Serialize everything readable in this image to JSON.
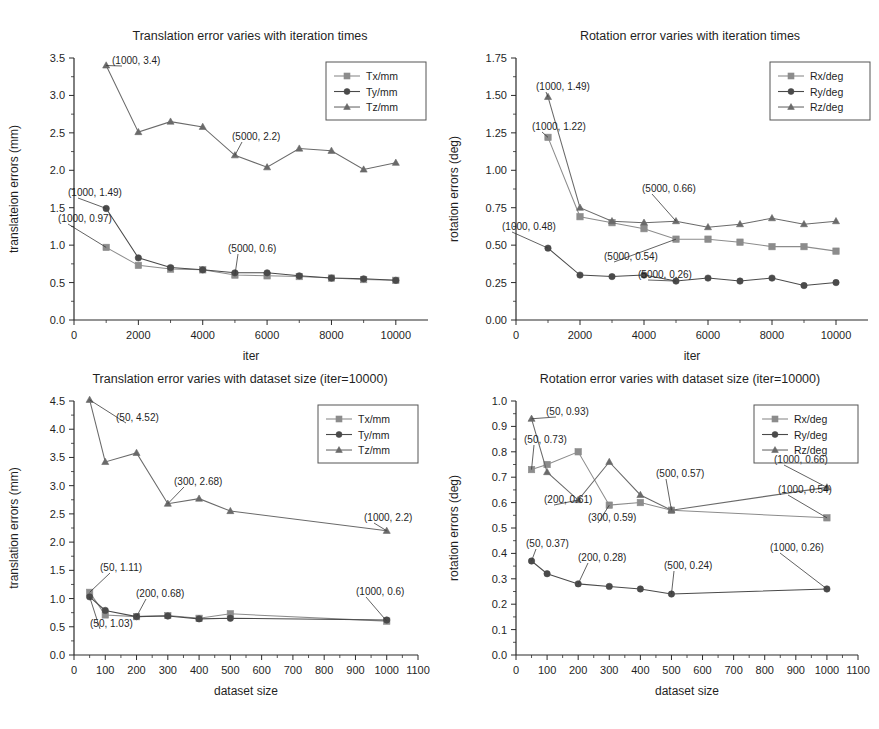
{
  "figure": {
    "background": "#ffffff",
    "series_colors": {
      "x": "#8c8c8c",
      "y": "#4a4a4a",
      "z": "#6a6a6a"
    }
  },
  "chart_data": [
    {
      "id": "translation-vs-iterations",
      "type": "line",
      "title": "Translation error varies with iteration times",
      "xlabel": "iter",
      "ylabel": "translateion errors (mm)",
      "xlim": [
        0,
        11000
      ],
      "ylim": [
        0.0,
        3.5
      ],
      "xticks": [
        0,
        2000,
        4000,
        6000,
        8000,
        10000
      ],
      "xticklabels": [
        "0",
        "2000",
        "4000",
        "6000",
        "8000",
        "10000"
      ],
      "yticks": [
        0.0,
        0.5,
        1.0,
        1.5,
        2.0,
        2.5,
        3.0,
        3.5
      ],
      "yticklabels": [
        "0.0",
        "0.5",
        "1.0",
        "1.5",
        "2.0",
        "2.5",
        "3.0",
        "3.5"
      ],
      "grid": false,
      "legend_position": "upper right",
      "x": [
        1000,
        2000,
        3000,
        4000,
        5000,
        6000,
        7000,
        8000,
        9000,
        10000
      ],
      "series": [
        {
          "name": "Tx/mm",
          "marker": "square",
          "values": [
            0.97,
            0.73,
            0.68,
            0.67,
            0.6,
            0.59,
            0.58,
            0.56,
            0.54,
            0.53
          ]
        },
        {
          "name": "Ty/mm",
          "marker": "circle",
          "values": [
            1.49,
            0.83,
            0.7,
            0.67,
            0.63,
            0.63,
            0.59,
            0.56,
            0.55,
            0.53
          ]
        },
        {
          "name": "Tz/mm",
          "marker": "triangle",
          "values": [
            3.4,
            2.51,
            2.65,
            2.58,
            2.2,
            2.04,
            2.29,
            2.26,
            2.01,
            2.1
          ]
        }
      ],
      "annotations": [
        {
          "text": "(1000, 3.4)",
          "point": [
            1000,
            3.4
          ]
        },
        {
          "text": "(5000, 2.2)",
          "point": [
            5000,
            2.2
          ]
        },
        {
          "text": "(1000, 1.49)",
          "point": [
            1000,
            1.49
          ]
        },
        {
          "text": "(1000, 0.97)",
          "point": [
            1000,
            0.97
          ]
        },
        {
          "text": "(5000, 0.6)",
          "point": [
            5000,
            0.6
          ]
        }
      ]
    },
    {
      "id": "rotation-vs-iterations",
      "type": "line",
      "title": "Rotation error varies with iteration times",
      "xlabel": "iter",
      "ylabel": "rotation errors (deg)",
      "xlim": [
        0,
        11000
      ],
      "ylim": [
        0.0,
        1.75
      ],
      "xticks": [
        0,
        2000,
        4000,
        6000,
        8000,
        10000
      ],
      "xticklabels": [
        "0",
        "2000",
        "4000",
        "6000",
        "8000",
        "10000"
      ],
      "yticks": [
        0.0,
        0.25,
        0.5,
        0.75,
        1.0,
        1.25,
        1.5,
        1.75
      ],
      "yticklabels": [
        "0.00",
        "0.25",
        "0.50",
        "0.75",
        "1.00",
        "1.25",
        "1.50",
        "1.75"
      ],
      "grid": false,
      "legend_position": "upper right",
      "x": [
        1000,
        2000,
        3000,
        4000,
        5000,
        6000,
        7000,
        8000,
        9000,
        10000
      ],
      "series": [
        {
          "name": "Rx/deg",
          "marker": "square",
          "values": [
            1.22,
            0.69,
            0.65,
            0.61,
            0.54,
            0.54,
            0.52,
            0.49,
            0.49,
            0.46
          ]
        },
        {
          "name": "Ry/deg",
          "marker": "circle",
          "values": [
            0.48,
            0.3,
            0.29,
            0.3,
            0.26,
            0.28,
            0.26,
            0.28,
            0.23,
            0.25
          ]
        },
        {
          "name": "Rz/deg",
          "marker": "triangle",
          "values": [
            1.49,
            0.75,
            0.66,
            0.65,
            0.66,
            0.62,
            0.64,
            0.68,
            0.64,
            0.66
          ]
        }
      ],
      "annotations": [
        {
          "text": "(1000, 1.49)",
          "point": [
            1000,
            1.49
          ]
        },
        {
          "text": "(1000, 1.22)",
          "point": [
            1000,
            1.22
          ]
        },
        {
          "text": "(5000, 0.66)",
          "point": [
            5000,
            0.66
          ]
        },
        {
          "text": "(1000, 0.48)",
          "point": [
            1000,
            0.48
          ]
        },
        {
          "text": "(5000, 0.54)",
          "point": [
            5000,
            0.54
          ]
        },
        {
          "text": "(5000, 0.26)",
          "point": [
            5000,
            0.26
          ]
        }
      ]
    },
    {
      "id": "translation-vs-dataset-size",
      "type": "line",
      "title": "Translation error varies with dataset size (iter=10000)",
      "xlabel": "dataset size",
      "ylabel": "translation errors (mm)",
      "xlim": [
        0,
        1100
      ],
      "ylim": [
        0.0,
        4.5
      ],
      "xticks": [
        0,
        100,
        200,
        300,
        400,
        500,
        600,
        700,
        800,
        900,
        1000,
        1100
      ],
      "xticklabels": [
        "0",
        "100",
        "200",
        "300",
        "400",
        "500",
        "600",
        "700",
        "800",
        "900",
        "1000",
        "1100"
      ],
      "yticks": [
        0.0,
        0.5,
        1.0,
        1.5,
        2.0,
        2.5,
        3.0,
        3.5,
        4.0,
        4.5
      ],
      "yticklabels": [
        "0.0",
        "0.5",
        "1.0",
        "1.5",
        "2.0",
        "2.5",
        "3.0",
        "3.5",
        "4.0",
        "4.5"
      ],
      "grid": false,
      "legend_position": "upper right",
      "x": [
        50,
        100,
        200,
        300,
        400,
        500,
        1000
      ],
      "series": [
        {
          "name": "Tx/mm",
          "marker": "square",
          "values": [
            1.11,
            0.71,
            0.68,
            0.7,
            0.65,
            0.73,
            0.6
          ]
        },
        {
          "name": "Ty/mm",
          "marker": "circle",
          "values": [
            1.03,
            0.79,
            0.68,
            0.69,
            0.64,
            0.65,
            0.62
          ]
        },
        {
          "name": "Tz/mm",
          "marker": "triangle",
          "values": [
            4.52,
            3.42,
            3.58,
            2.68,
            2.77,
            2.55,
            2.2
          ]
        }
      ],
      "annotations": [
        {
          "text": "(50, 4.52)",
          "point": [
            50,
            4.52
          ]
        },
        {
          "text": "(300, 2.68)",
          "point": [
            300,
            2.68
          ]
        },
        {
          "text": "(1000, 2.2)",
          "point": [
            1000,
            2.2
          ]
        },
        {
          "text": "(50, 1.11)",
          "point": [
            50,
            1.11
          ]
        },
        {
          "text": "(200, 0.68)",
          "point": [
            200,
            0.68
          ]
        },
        {
          "text": "(1000, 0.6)",
          "point": [
            1000,
            0.6
          ]
        },
        {
          "text": "(50, 1.03)",
          "point": [
            50,
            1.03
          ]
        }
      ]
    },
    {
      "id": "rotation-vs-dataset-size",
      "type": "line",
      "title": "Rotation error varies with dataset size (iter=10000)",
      "xlabel": "dataset size",
      "ylabel": "rotation errors (deg)",
      "xlim": [
        0,
        1100
      ],
      "ylim": [
        0.0,
        1.0
      ],
      "xticks": [
        0,
        100,
        200,
        300,
        400,
        500,
        600,
        700,
        800,
        900,
        1000,
        1100
      ],
      "xticklabels": [
        "0",
        "100",
        "200",
        "300",
        "400",
        "500",
        "600",
        "700",
        "800",
        "900",
        "1000",
        "1100"
      ],
      "yticks": [
        0.0,
        0.1,
        0.2,
        0.3,
        0.4,
        0.5,
        0.6,
        0.7,
        0.8,
        0.9,
        1.0
      ],
      "yticklabels": [
        "0.0",
        "0.1",
        "0.2",
        "0.3",
        "0.4",
        "0.5",
        "0.6",
        "0.7",
        "0.8",
        "0.9",
        "1.0"
      ],
      "grid": false,
      "legend_position": "upper right",
      "x": [
        50,
        100,
        200,
        300,
        400,
        500,
        1000
      ],
      "series": [
        {
          "name": "Rx/deg",
          "marker": "square",
          "values": [
            0.73,
            0.75,
            0.8,
            0.59,
            0.6,
            0.57,
            0.54
          ]
        },
        {
          "name": "Ry/deg",
          "marker": "circle",
          "values": [
            0.37,
            0.32,
            0.28,
            0.27,
            0.26,
            0.24,
            0.26
          ]
        },
        {
          "name": "Rz/deg",
          "marker": "triangle",
          "values": [
            0.93,
            0.72,
            0.61,
            0.76,
            0.63,
            0.57,
            0.66
          ]
        }
      ],
      "annotations": [
        {
          "text": "(50, 0.93)",
          "point": [
            50,
            0.93
          ]
        },
        {
          "text": "(50, 0.73)",
          "point": [
            50,
            0.73
          ]
        },
        {
          "text": "(200, 0.61)",
          "point": [
            200,
            0.61
          ]
        },
        {
          "text": "(300, 0.59)",
          "point": [
            300,
            0.59
          ]
        },
        {
          "text": "(500, 0.57)",
          "point": [
            500,
            0.57
          ]
        },
        {
          "text": "(1000, 0.66)",
          "point": [
            1000,
            0.66
          ]
        },
        {
          "text": "(1000, 0.54)",
          "point": [
            1000,
            0.54
          ]
        },
        {
          "text": "(50, 0.37)",
          "point": [
            50,
            0.37
          ]
        },
        {
          "text": "(200, 0.28)",
          "point": [
            200,
            0.28
          ]
        },
        {
          "text": "(500, 0.24)",
          "point": [
            500,
            0.24
          ]
        },
        {
          "text": "(1000, 0.26)",
          "point": [
            1000,
            0.26
          ]
        }
      ]
    }
  ]
}
